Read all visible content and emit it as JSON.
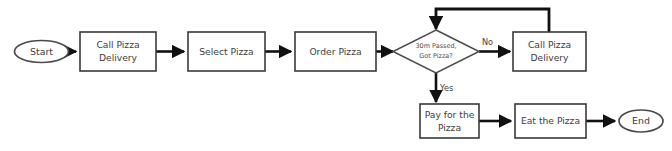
{
  "diagram": {
    "background_color": "#ffffff",
    "stroke_color": "#111111",
    "node_border_color": "#3a3a3a",
    "text_color": "#404040"
  },
  "nodes": {
    "start": {
      "label": "Start",
      "shape": "oval"
    },
    "call_pizza_delivery_1": {
      "label_line1": "Call Pizza",
      "label_line2": "Delivery",
      "shape": "rectangle"
    },
    "select_pizza": {
      "label": "Select Pizza",
      "shape": "rectangle"
    },
    "order_pizza": {
      "label": "Order Pizza",
      "shape": "rectangle"
    },
    "decision": {
      "label_line1": "30m Passed,",
      "label_line2": "Got Pizza?",
      "shape": "diamond"
    },
    "call_pizza_delivery_2": {
      "label_line1": "Call Pizza",
      "label_line2": "Delivery",
      "shape": "rectangle"
    },
    "pay_for_the_pizza": {
      "label_line1": "Pay for the",
      "label_line2": "Pizza",
      "shape": "rectangle"
    },
    "eat_the_pizza": {
      "label": "Eat the Pizza",
      "shape": "rectangle"
    },
    "end": {
      "label": "End",
      "shape": "oval"
    }
  },
  "edge_labels": {
    "no": "No",
    "yes": "Yes"
  }
}
